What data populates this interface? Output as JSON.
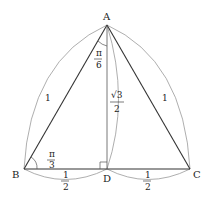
{
  "diagram": {
    "points": {
      "A": "A",
      "B": "B",
      "C": "C",
      "D": "D"
    },
    "sides": {
      "AB": "1",
      "AC": "1",
      "BD_num": "1",
      "BD_den": "2",
      "DC_num": "1",
      "DC_den": "2",
      "AD_num": "√3",
      "AD_den": "2"
    },
    "angles": {
      "at_A_num": "π",
      "at_A_den": "6",
      "at_B_num": "π",
      "at_B_den": "3"
    },
    "colors": {
      "line": "#333333",
      "arc": "#888888",
      "text": "#222222"
    }
  }
}
